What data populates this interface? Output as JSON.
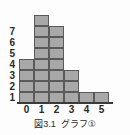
{
  "figure": {
    "caption_number": "図3.1",
    "caption_title": "グラフ①",
    "caption_full": "図3.1　グラフ①"
  },
  "colors": {
    "bar_fill": "#a8a8a8",
    "bar_stroke": "#5a5a5a",
    "axis": "#3a3a3a",
    "text": "#2a2a2a",
    "background": "#fdfdfd"
  },
  "chart_data": {
    "type": "bar",
    "subtitle": "",
    "xlabel": "",
    "ylabel": "",
    "categories": [
      "0",
      "1",
      "2",
      "3",
      "4",
      "5"
    ],
    "values": [
      4,
      8,
      7,
      3,
      1,
      1
    ],
    "x_tick_labels": [
      "0",
      "1",
      "2",
      "3",
      "4",
      "5"
    ],
    "y_tick_labels": [
      "1",
      "2",
      "3",
      "4",
      "5",
      "6",
      "7"
    ],
    "xlim": [
      0,
      6
    ],
    "ylim": [
      0,
      8
    ],
    "grid": true,
    "legend": false,
    "legend_position": "none",
    "annotations": []
  }
}
